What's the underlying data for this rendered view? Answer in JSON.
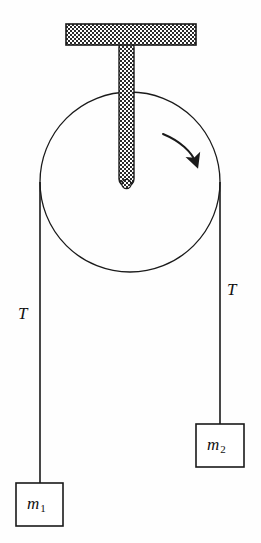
{
  "diagram": {
    "type": "physics-free-body-diagram",
    "stroke_color": "#1a1a1a",
    "fill_pattern_color": "#2b2b2b",
    "background": "#fefefe"
  },
  "ceiling_bracket": {
    "name": "ceiling-mount",
    "x": 66,
    "y": 24,
    "width": 130,
    "height": 20,
    "hatch": "checker"
  },
  "support_stem": {
    "name": "support-rod",
    "x": 119,
    "y": 44,
    "width": 15,
    "height": 144,
    "hatch": "checker"
  },
  "pulley": {
    "name": "pulley-wheel",
    "cx": 130,
    "cy": 182,
    "r": 90,
    "axle_cx": 126,
    "axle_cy": 185,
    "axle_r": 5
  },
  "rotation_arrow": {
    "name": "clockwise-rotation-arrow",
    "direction": "clockwise",
    "start_x": 163,
    "start_y": 134,
    "end_x": 196,
    "end_y": 165
  },
  "ropes": [
    {
      "name": "left-rope",
      "x": 40,
      "y_top": 182,
      "y_bottom": 483
    },
    {
      "name": "right-rope",
      "x": 220,
      "y_top": 182,
      "y_bottom": 424
    }
  ],
  "labels": {
    "tension_left": {
      "text": "T",
      "x": 18,
      "y": 305
    },
    "tension_right": {
      "text": "T",
      "x": 227,
      "y": 281
    }
  },
  "masses": [
    {
      "name": "mass-block-m2",
      "symbol": "m",
      "subscript": "2",
      "x": 196,
      "y": 424,
      "width": 48,
      "height": 43
    },
    {
      "name": "mass-block-m1",
      "symbol": "m",
      "subscript": "1",
      "x": 16,
      "y": 483,
      "width": 47,
      "height": 43
    }
  ]
}
